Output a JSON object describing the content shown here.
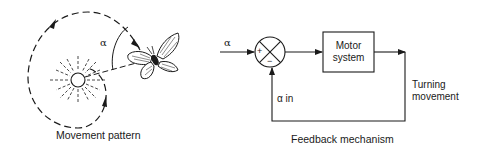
{
  "left_panel": {
    "caption": "Movement pattern",
    "angle_label": "α"
  },
  "right_panel": {
    "caption": "Feedback mechanism",
    "input_label": "α",
    "comparator": {
      "plus": "+",
      "minus": "−"
    },
    "motor_box": {
      "line1": "Motor",
      "line2": "system"
    },
    "output_label": {
      "line1": "Turning",
      "line2": "movement"
    },
    "feedback_label": "α in"
  },
  "colors": {
    "stroke": "#1a1a1a",
    "background": "#ffffff"
  }
}
